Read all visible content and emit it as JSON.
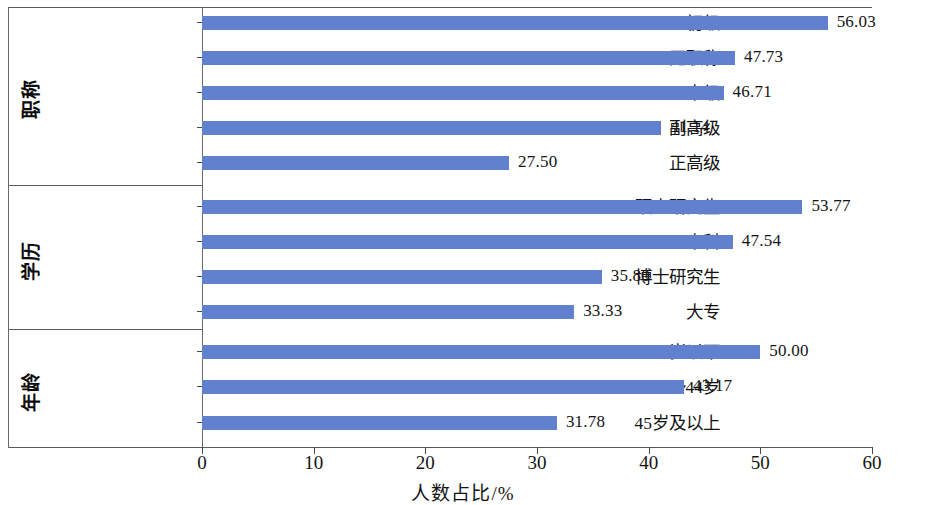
{
  "chart_data": {
    "type": "bar",
    "orientation": "horizontal",
    "title": "",
    "xlabel": "人数占比/%",
    "ylabel": "",
    "xlim": [
      0,
      60
    ],
    "xticks": [
      0,
      10,
      20,
      30,
      40,
      50,
      60
    ],
    "grid": false,
    "legend": "none",
    "bar_color": "#6180CE",
    "value_label_format": "2 decimals",
    "groups": [
      {
        "group_label": "职称",
        "categories": [
          "初级",
          "无职称",
          "中级",
          "副高级",
          "正高级"
        ],
        "values": [
          56.03,
          47.73,
          46.71,
          41.14,
          27.5
        ]
      },
      {
        "group_label": "学历",
        "categories": [
          "硕士研究生",
          "本科",
          "博士研究生",
          "大专"
        ],
        "values": [
          53.77,
          47.54,
          35.8,
          33.33
        ]
      },
      {
        "group_label": "年龄",
        "categories": [
          "35岁以下",
          "35～44岁",
          "45岁及以上"
        ],
        "values": [
          50.0,
          43.17,
          31.78
        ]
      }
    ],
    "categories": [
      "初级",
      "无职称",
      "中级",
      "副高级",
      "正高级",
      "硕士研究生",
      "本科",
      "博士研究生",
      "大专",
      "35岁以下",
      "35～44岁",
      "45岁及以上"
    ],
    "values": [
      56.03,
      47.73,
      46.71,
      41.14,
      27.5,
      53.77,
      47.54,
      35.8,
      33.33,
      50.0,
      43.17,
      31.78
    ],
    "value_labels": [
      "56.03",
      "47.73",
      "46.71",
      "41.14",
      "27.50",
      "53.77",
      "47.54",
      "35.80",
      "33.33",
      "50.00",
      "43.17",
      "31.78"
    ],
    "xtick_labels": [
      "0",
      "10",
      "20",
      "30",
      "40",
      "50",
      "60"
    ]
  }
}
